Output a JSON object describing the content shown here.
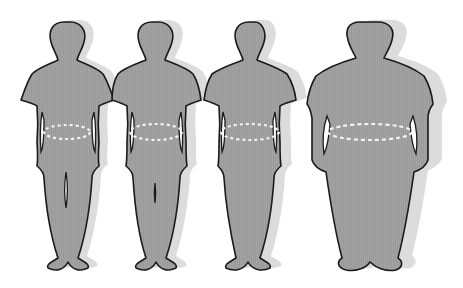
{
  "figure": {
    "colors": {
      "body_fill": "#9a9a9a",
      "outline": "#1a1a1a",
      "shadow": "#dcdcdc",
      "waist_dash": "#f2f2f2",
      "background": "#ffffff"
    },
    "figures": [
      {
        "label": "figure-1-normal",
        "waist_marker": "dashed-ellipse"
      },
      {
        "label": "figure-2-overweight",
        "waist_marker": "dashed-ellipse"
      },
      {
        "label": "figure-3-obese",
        "waist_marker": "dashed-ellipse"
      },
      {
        "label": "figure-4-severely-obese",
        "waist_marker": "dashed-ellipse"
      }
    ]
  }
}
